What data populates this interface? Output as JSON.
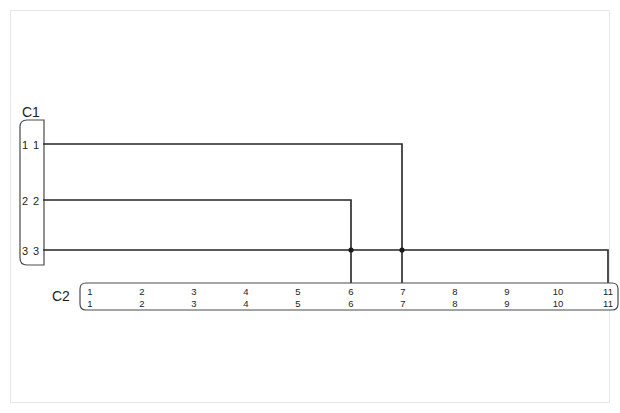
{
  "diagram": {
    "background_color": "#ffffff",
    "frame_color": "#e8e8e8",
    "wire_color": "#242424",
    "connector_outline_color": "#4a4a4a",
    "text_color": "#1d1d1d"
  },
  "connectors": {
    "c1": {
      "label": "C1",
      "pins": [
        {
          "row_top": "1",
          "row_bottom": "1"
        },
        {
          "row_top": "2",
          "row_bottom": "2"
        },
        {
          "row_top": "3",
          "row_bottom": "3"
        }
      ]
    },
    "c2": {
      "label": "C2",
      "pins": [
        {
          "row_top": "1",
          "row_bottom": "1"
        },
        {
          "row_top": "2",
          "row_bottom": "2"
        },
        {
          "row_top": "3",
          "row_bottom": "3"
        },
        {
          "row_top": "4",
          "row_bottom": "4"
        },
        {
          "row_top": "5",
          "row_bottom": "5"
        },
        {
          "row_top": "6",
          "row_bottom": "6"
        },
        {
          "row_top": "7",
          "row_bottom": "7"
        },
        {
          "row_top": "8",
          "row_bottom": "8"
        },
        {
          "row_top": "9",
          "row_bottom": "9"
        },
        {
          "row_top": "10",
          "row_bottom": "10"
        },
        {
          "row_top": "11",
          "row_bottom": "11"
        }
      ]
    }
  },
  "wires": [
    {
      "name": "wire-c1p1-to-c2p7",
      "from": "C1.1",
      "to": "C2.7"
    },
    {
      "name": "wire-c1p2-to-c2p6",
      "from": "C1.2",
      "to": "C2.6"
    },
    {
      "name": "wire-c1p3-to-c2p11",
      "from": "C1.3",
      "to": "C2.11"
    }
  ],
  "junctions": [
    {
      "name": "junction-c2p6-crossing",
      "at": "C2.6"
    },
    {
      "name": "junction-c2p7-crossing",
      "at": "C2.7"
    }
  ]
}
